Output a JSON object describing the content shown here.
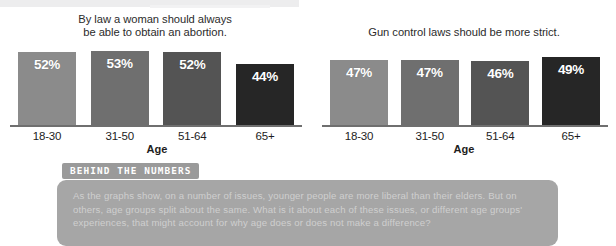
{
  "charts": [
    {
      "title": "By law a woman should always be able to obtain an abortion.",
      "title_line1": "By law a woman should always",
      "title_line2": "be able to obtain an abortion.",
      "axis_name": "Age",
      "bars": [
        {
          "label": "18-30",
          "value_label": "52%",
          "value": 52,
          "color": "#8b8b8b"
        },
        {
          "label": "31-50",
          "value_label": "53%",
          "value": 53,
          "color": "#6f6f6f"
        },
        {
          "label": "51-64",
          "value_label": "52%",
          "value": 52,
          "color": "#545454"
        },
        {
          "label": "65+",
          "value_label": "44%",
          "value": 44,
          "color": "#262626"
        }
      ]
    },
    {
      "title": "Gun control laws should be more strict.",
      "title_line1": "Gun control laws should be more strict.",
      "title_line2": "",
      "axis_name": "Age",
      "bars": [
        {
          "label": "18-30",
          "value_label": "47%",
          "value": 47,
          "color": "#8b8b8b"
        },
        {
          "label": "31-50",
          "value_label": "47%",
          "value": 47,
          "color": "#6f6f6f"
        },
        {
          "label": "51-64",
          "value_label": "46%",
          "value": 46,
          "color": "#545454"
        },
        {
          "label": "65+",
          "value_label": "49%",
          "value": 49,
          "color": "#262626"
        }
      ]
    }
  ],
  "callout": {
    "tab_label": "BEHIND THE NUMBERS",
    "body": "As the graphs show, on a number of issues, younger people are more liberal than their elders. But on others, age groups split about the same. What is it about each of these issues, or different age groups' experiences, that might account for why age does or does not make a difference?"
  },
  "chart_data": [
    {
      "type": "bar",
      "title": "By law a woman should always be able to obtain an abortion.",
      "xlabel": "Age",
      "ylabel": "",
      "categories": [
        "18-30",
        "31-50",
        "51-64",
        "65+"
      ],
      "values": [
        52,
        53,
        52,
        44
      ],
      "data_labels": [
        "52%",
        "53%",
        "52%",
        "44%"
      ],
      "bar_colors": [
        "#8b8b8b",
        "#6f6f6f",
        "#545454",
        "#262626"
      ],
      "ylim": [
        0,
        60
      ],
      "grid": false,
      "legend": "none"
    },
    {
      "type": "bar",
      "title": "Gun control laws should be more strict.",
      "xlabel": "Age",
      "ylabel": "",
      "categories": [
        "18-30",
        "31-50",
        "51-64",
        "65+"
      ],
      "values": [
        47,
        47,
        46,
        49
      ],
      "data_labels": [
        "47%",
        "47%",
        "46%",
        "49%"
      ],
      "bar_colors": [
        "#8b8b8b",
        "#6f6f6f",
        "#545454",
        "#262626"
      ],
      "ylim": [
        0,
        60
      ],
      "grid": false,
      "legend": "none"
    }
  ]
}
